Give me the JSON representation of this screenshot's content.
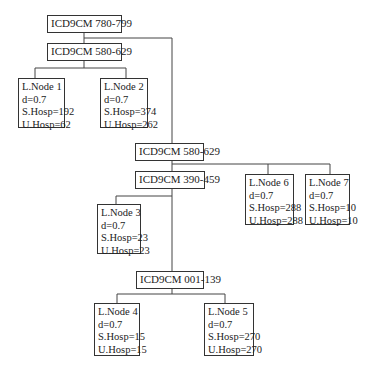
{
  "diagram": {
    "type": "decision-tree",
    "split_nodes": [
      {
        "id": "root",
        "label": "ICD9CM 780-799"
      },
      {
        "id": "s1",
        "label": "ICD9CM 580-629"
      },
      {
        "id": "s2",
        "label": "ICD9CM 580-629"
      },
      {
        "id": "s3",
        "label": "ICD9CM 390-459"
      },
      {
        "id": "s4",
        "label": "ICD9CM 001-139"
      }
    ],
    "leaf_nodes": [
      {
        "id": "leaf1",
        "name": "L.Node 1",
        "d": "d=0.7",
        "s_hosp": "S.Hosp=192",
        "u_hosp": "U.Hosp=62"
      },
      {
        "id": "leaf2",
        "name": "L.Node 2",
        "d": "d=0.7",
        "s_hosp": "S.Hosp=374",
        "u_hosp": "U.Hosp=262"
      },
      {
        "id": "leaf3",
        "name": "L.Node 3",
        "d": "d=0.7",
        "s_hosp": "S.Hosp=23",
        "u_hosp": "U.Hosp=23"
      },
      {
        "id": "leaf4",
        "name": "L.Node 4",
        "d": "d=0.7",
        "s_hosp": "S.Hosp=15",
        "u_hosp": "U.Hosp=15"
      },
      {
        "id": "leaf5",
        "name": "L.Node 5",
        "d": "d=0.7",
        "s_hosp": "S.Hosp=270",
        "u_hosp": "U.Hosp=270"
      },
      {
        "id": "leaf6",
        "name": "L.Node 6",
        "d": "d=0.7",
        "s_hosp": "S.Hosp=288",
        "u_hosp": "U.Hosp=288"
      },
      {
        "id": "leaf7",
        "name": "L.Node 7",
        "d": "d=0.7",
        "s_hosp": "S.Hosp=10",
        "u_hosp": "U.Hosp=10"
      }
    ],
    "edges": [
      [
        "root",
        "s1"
      ],
      [
        "root",
        "s2"
      ],
      [
        "s1",
        "leaf1"
      ],
      [
        "s1",
        "leaf2"
      ],
      [
        "s2",
        "s3"
      ],
      [
        "s2",
        "leaf6"
      ],
      [
        "s2",
        "leaf7"
      ],
      [
        "s3",
        "leaf3"
      ],
      [
        "s3",
        "s4"
      ],
      [
        "s4",
        "leaf4"
      ],
      [
        "s4",
        "leaf5"
      ]
    ]
  }
}
